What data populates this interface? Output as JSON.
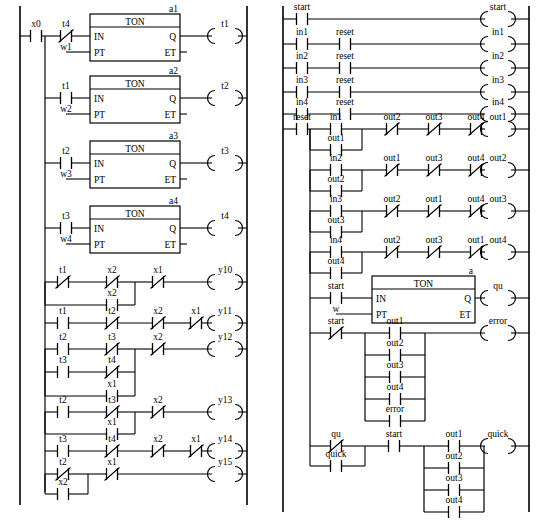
{
  "diagram": {
    "type": "ladder-logic",
    "panels": 2,
    "symbols": {
      "no_contact": "normally-open-contact",
      "nc_contact": "normally-closed-contact",
      "coil": "output-coil",
      "ton": "on-delay-timer-block"
    }
  },
  "left_panel": {
    "name": "left-ladder-panel",
    "rungs": [
      {
        "id": "rung-a1",
        "contacts": [
          {
            "label": "x0",
            "type": "no"
          },
          {
            "label": "t4",
            "type": "nc"
          }
        ],
        "block": {
          "name": "TON",
          "instance": "a1",
          "in_label": "IN",
          "pt_label": "PT",
          "q_label": "Q",
          "et_label": "ET",
          "pt_value": "w1"
        },
        "coil": "t1"
      },
      {
        "id": "rung-a2",
        "contacts": [
          {
            "label": "t1",
            "type": "no"
          }
        ],
        "block": {
          "name": "TON",
          "instance": "a2",
          "in_label": "IN",
          "pt_label": "PT",
          "q_label": "Q",
          "et_label": "ET",
          "pt_value": "w2"
        },
        "coil": "t2"
      },
      {
        "id": "rung-a3",
        "contacts": [
          {
            "label": "t2",
            "type": "no"
          }
        ],
        "block": {
          "name": "TON",
          "instance": "a3",
          "in_label": "IN",
          "pt_label": "PT",
          "q_label": "Q",
          "et_label": "ET",
          "pt_value": "w3"
        },
        "coil": "t3"
      },
      {
        "id": "rung-a4",
        "contacts": [
          {
            "label": "t3",
            "type": "no"
          }
        ],
        "block": {
          "name": "TON",
          "instance": "a4",
          "in_label": "IN",
          "pt_label": "PT",
          "q_label": "Q",
          "et_label": "ET",
          "pt_value": "w4"
        },
        "coil": "t4"
      },
      {
        "id": "rung-y10",
        "contacts": [
          {
            "label": "t1",
            "type": "nc"
          },
          {
            "label": "x2",
            "type": "nc"
          },
          {
            "label": "x1",
            "type": "nc"
          }
        ],
        "branch": [
          {
            "label": "x2",
            "type": "no"
          }
        ],
        "coil": "y10"
      },
      {
        "id": "rung-y11",
        "contacts": [
          {
            "label": "t1",
            "type": "no"
          },
          {
            "label": "t2",
            "type": "nc"
          },
          {
            "label": "x2",
            "type": "nc"
          },
          {
            "label": "x1",
            "type": "nc"
          }
        ],
        "coil": "y11"
      },
      {
        "id": "rung-y12",
        "contacts": [
          {
            "label": "t2",
            "type": "no"
          },
          {
            "label": "t3",
            "type": "nc"
          },
          {
            "label": "x2",
            "type": "nc"
          }
        ],
        "branch2": [
          {
            "label": "t3",
            "type": "no"
          },
          {
            "label": "t4",
            "type": "nc"
          }
        ],
        "branch3": [
          {
            "label": "x1",
            "type": "no"
          }
        ],
        "coil": "y12"
      },
      {
        "id": "rung-y13",
        "contacts": [
          {
            "label": "t2",
            "type": "no"
          },
          {
            "label": "t3",
            "type": "nc"
          },
          {
            "label": "x2",
            "type": "nc"
          }
        ],
        "branch": [
          {
            "label": "x1",
            "type": "no"
          }
        ],
        "coil": "y13"
      },
      {
        "id": "rung-y14",
        "contacts": [
          {
            "label": "t3",
            "type": "no"
          },
          {
            "label": "t4",
            "type": "nc"
          },
          {
            "label": "x2",
            "type": "nc"
          },
          {
            "label": "x1",
            "type": "nc"
          }
        ],
        "coil": "y14"
      },
      {
        "id": "rung-y15",
        "contacts": [
          {
            "label": "t2",
            "type": "nc"
          },
          {
            "label": "x1",
            "type": "nc"
          }
        ],
        "branch": [
          {
            "label": "x2",
            "type": "no"
          }
        ],
        "coil": "y15"
      }
    ]
  },
  "right_panel": {
    "name": "right-ladder-panel",
    "rungs": [
      {
        "id": "rung-start",
        "contacts": [
          {
            "label": "start",
            "type": "no"
          }
        ],
        "coil": "start"
      },
      {
        "id": "rung-in1",
        "contacts": [
          {
            "label": "in1",
            "type": "no"
          },
          {
            "label": "reset",
            "type": "no"
          }
        ],
        "coil": "in1"
      },
      {
        "id": "rung-in2",
        "contacts": [
          {
            "label": "in2",
            "type": "no"
          },
          {
            "label": "reset",
            "type": "no"
          }
        ],
        "coil": "in2"
      },
      {
        "id": "rung-in3",
        "contacts": [
          {
            "label": "in3",
            "type": "no"
          },
          {
            "label": "reset",
            "type": "no"
          }
        ],
        "coil": "in3"
      },
      {
        "id": "rung-in4",
        "contacts": [
          {
            "label": "in4",
            "type": "no"
          },
          {
            "label": "reset",
            "type": "no"
          }
        ],
        "coil": "in4"
      },
      {
        "id": "rung-out1",
        "seed": {
          "label": "reset",
          "type": "no"
        },
        "latch": [
          {
            "label": "in1",
            "type": "no"
          },
          {
            "label": "out1",
            "type": "no"
          }
        ],
        "contacts": [
          {
            "label": "out2",
            "type": "nc"
          },
          {
            "label": "out3",
            "type": "nc"
          },
          {
            "label": "out4",
            "type": "nc"
          }
        ],
        "coil": "out1"
      },
      {
        "id": "rung-out2",
        "latch": [
          {
            "label": "in2",
            "type": "no"
          },
          {
            "label": "out2",
            "type": "no"
          }
        ],
        "contacts": [
          {
            "label": "out1",
            "type": "nc"
          },
          {
            "label": "out3",
            "type": "nc"
          },
          {
            "label": "out4",
            "type": "nc"
          }
        ],
        "coil": "out2"
      },
      {
        "id": "rung-out3",
        "latch": [
          {
            "label": "in3",
            "type": "no"
          },
          {
            "label": "out3",
            "type": "no"
          }
        ],
        "contacts": [
          {
            "label": "out2",
            "type": "nc"
          },
          {
            "label": "out1",
            "type": "nc"
          },
          {
            "label": "out4",
            "type": "nc"
          }
        ],
        "coil": "out3"
      },
      {
        "id": "rung-out4",
        "latch": [
          {
            "label": "in4",
            "type": "no"
          },
          {
            "label": "out4",
            "type": "no"
          }
        ],
        "contacts": [
          {
            "label": "out2",
            "type": "nc"
          },
          {
            "label": "out3",
            "type": "nc"
          },
          {
            "label": "out1",
            "type": "nc"
          }
        ],
        "coil": "out4"
      },
      {
        "id": "rung-qu",
        "contacts": [
          {
            "label": "start",
            "type": "no"
          }
        ],
        "block": {
          "name": "TON",
          "instance": "a",
          "in_label": "IN",
          "pt_label": "PT",
          "q_label": "Q",
          "et_label": "ET",
          "pt_value": "w"
        },
        "coil": "qu"
      },
      {
        "id": "rung-error",
        "contacts": [
          {
            "label": "start",
            "type": "nc"
          }
        ],
        "parallel": [
          {
            "label": "out1",
            "type": "no"
          },
          {
            "label": "out2",
            "type": "no"
          },
          {
            "label": "out3",
            "type": "no"
          },
          {
            "label": "out4",
            "type": "no"
          },
          {
            "label": "error",
            "type": "no"
          }
        ],
        "coil": "error"
      },
      {
        "id": "rung-quick",
        "latch": [
          {
            "label": "qu",
            "type": "nc"
          },
          {
            "label": "quick",
            "type": "no"
          }
        ],
        "contacts": [
          {
            "label": "start",
            "type": "no"
          }
        ],
        "parallel": [
          {
            "label": "out1",
            "type": "no"
          },
          {
            "label": "out2",
            "type": "no"
          },
          {
            "label": "out3",
            "type": "no"
          },
          {
            "label": "out4",
            "type": "no"
          }
        ],
        "coil": "quick"
      }
    ]
  }
}
